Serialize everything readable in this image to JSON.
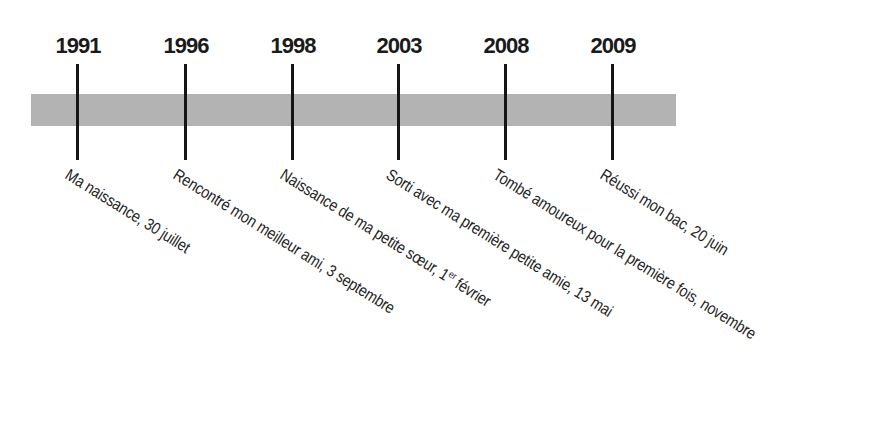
{
  "timeline": {
    "bar_color": "#b3b3b3",
    "tick_color": "#151515",
    "events": [
      {
        "year": "1991",
        "label": "Ma naissance, 30 juillet",
        "x": 78
      },
      {
        "year": "1996",
        "label": "Rencontré mon meilleur ami, 3 septembre",
        "x": 186
      },
      {
        "year": "1998",
        "label_pre": "Naissance de ma petite sœur, 1",
        "label_sup": "er",
        "label_post": " février",
        "x": 293
      },
      {
        "year": "2003",
        "label": "Sorti avec ma première petite amie, 13 mai",
        "x": 399
      },
      {
        "year": "2008",
        "label": "Tombé amoureux pour la première fois, novembre",
        "x": 506
      },
      {
        "year": "2009",
        "label": "Réussi mon bac, 20 juin",
        "x": 613
      }
    ]
  }
}
